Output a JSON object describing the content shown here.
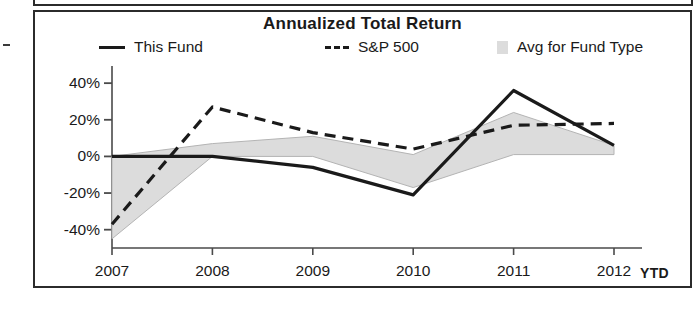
{
  "panel": {
    "title": "Annualized Total Return"
  },
  "legend": {
    "position": "top",
    "items": [
      {
        "label": "This Fund",
        "marker": "solid-line",
        "icon": "solid-line-swatch"
      },
      {
        "label": "S&P 500",
        "marker": "dashed-line",
        "icon": "dashed-line-swatch"
      },
      {
        "label": "Avg for Fund Type",
        "marker": "area-swatch",
        "icon": "gray-square-swatch"
      }
    ]
  },
  "axes": {
    "y_ticks": [
      "40%",
      "20%",
      "0%",
      "-20%",
      "-40%"
    ],
    "x_ticks": [
      "2007",
      "2008",
      "2009",
      "2010",
      "2011",
      "2012"
    ],
    "x_suffix": "YTD"
  },
  "colors": {
    "line": "#1a1a1a",
    "band_fill": "#dcdcdc",
    "band_edge": "#b4b4b4",
    "axis": "#4a4a4a",
    "frame": "#2b2b2b"
  },
  "chart_data": {
    "type": "line",
    "title": "Annualized Total Return",
    "xlabel": "",
    "ylabel": "",
    "categories": [
      "2007",
      "2008",
      "2009",
      "2010",
      "2011",
      "2012 YTD"
    ],
    "ylim": [
      -50,
      45
    ],
    "yticks": [
      -40,
      -20,
      0,
      20,
      40
    ],
    "ytick_format": "percent",
    "grid": false,
    "legend_position": "top",
    "series": [
      {
        "name": "This Fund",
        "style": "solid",
        "values": [
          0,
          0,
          -6,
          -21,
          36,
          6
        ]
      },
      {
        "name": "S&P 500",
        "style": "dashed",
        "values": [
          -37,
          27,
          13,
          4,
          17,
          18
        ]
      },
      {
        "name": "Avg for Fund Type",
        "style": "band",
        "upper": [
          0,
          7,
          11,
          1,
          24,
          6
        ],
        "lower": [
          -45,
          0,
          0,
          -17,
          1,
          1
        ]
      }
    ]
  }
}
